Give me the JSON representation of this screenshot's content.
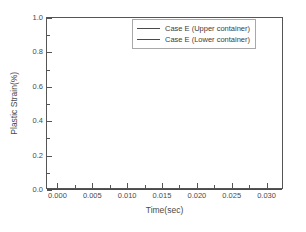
{
  "chart_data": {
    "type": "line",
    "title": "",
    "xlabel": "Time(sec)",
    "ylabel": "Plastic Strain(%)",
    "xlim": [
      -0.0015,
      0.0325
    ],
    "ylim": [
      0.0,
      1.0
    ],
    "grid": false,
    "legend_position": "upper-center-right",
    "x_ticks": [
      0.0,
      0.005,
      0.01,
      0.015,
      0.02,
      0.025,
      0.03
    ],
    "x_tick_labels": [
      "0.000",
      "0.005",
      "0.010",
      "0.015",
      "0.020",
      "0.025",
      "0.030"
    ],
    "x_minor_ticks": [
      0.0025,
      0.0075,
      0.0125,
      0.0175,
      0.0225,
      0.0275
    ],
    "y_ticks": [
      0.0,
      0.2,
      0.4,
      0.6,
      0.8,
      1.0
    ],
    "y_tick_labels": [
      "0.0",
      "0.2",
      "0.4",
      "0.6",
      "0.8",
      "1.0"
    ],
    "y_minor_ticks": [
      0.1,
      0.3,
      0.5,
      0.7,
      0.9
    ],
    "series": [
      {
        "name": "Case E (Upper container)",
        "color": "#4a4a4a",
        "x": [
          0.0,
          0.005,
          0.01,
          0.015,
          0.02,
          0.025,
          0.03
        ],
        "values": [
          0.0,
          0.0,
          0.0,
          0.0,
          0.0,
          0.0,
          0.0
        ]
      },
      {
        "name": "Case E (Lower container)",
        "color": "#4a4a4a",
        "x": [
          0.0,
          0.005,
          0.01,
          0.015,
          0.02,
          0.025,
          0.03
        ],
        "values": [
          0.0,
          0.0,
          0.0,
          0.0,
          0.0,
          0.0,
          0.0
        ]
      }
    ]
  },
  "axes": {
    "x_title": "Time(sec)",
    "y_title": "Plastic Strain(%)",
    "x_tick_labels": [
      "0.000",
      "0.005",
      "0.010",
      "0.015",
      "0.020",
      "0.025",
      "0.030"
    ],
    "y_tick_labels": [
      "0.0",
      "0.2",
      "0.4",
      "0.6",
      "0.8",
      "1.0"
    ]
  },
  "legend": {
    "entries": [
      {
        "label": "Case E (Upper container)",
        "color": "#4a4a4a"
      },
      {
        "label": "Case E (Lower container)",
        "color": "#4a4a4a"
      }
    ]
  },
  "style": {
    "background": "#ffffff",
    "axis_color": "#555555",
    "text_color": "#4a4a4a",
    "legend_border": "#a8a8a8"
  }
}
